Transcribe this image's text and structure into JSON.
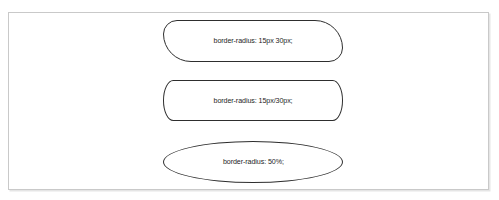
{
  "figure": {
    "background_color": "#ffffff",
    "frame_border_color": "#c9c9c9",
    "shape_stroke_color": "#2e2e2e",
    "label_text_color": "#1e1e1e"
  },
  "shapes": [
    {
      "id": "radius-two-value",
      "label": "border-radius: 15px 30px;",
      "form": "rounded-rectangle"
    },
    {
      "id": "radius-slash",
      "label": "border-radius: 15px/30px;",
      "form": "rounded-rectangle"
    },
    {
      "id": "radius-percent",
      "label": "border-radius: 50%;",
      "form": "ellipse"
    }
  ]
}
